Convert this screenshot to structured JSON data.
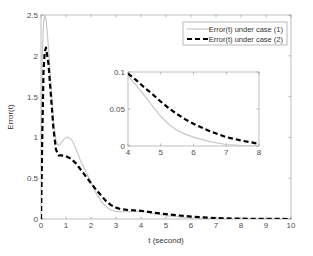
{
  "chart_data": [
    {
      "type": "line",
      "role": "main",
      "title": "",
      "xlabel": "t (second)",
      "ylabel": "Error(t)",
      "xlim": [
        0,
        10
      ],
      "ylim": [
        0,
        2.5
      ],
      "xticks": [
        0,
        1,
        2,
        3,
        4,
        5,
        6,
        7,
        8,
        9,
        10
      ],
      "yticks": [
        0,
        0.5,
        1,
        1.5,
        2,
        2.5
      ],
      "xtick_labels": [
        "0",
        "1",
        "2",
        "3",
        "4",
        "5",
        "6",
        "7",
        "8",
        "9",
        "10"
      ],
      "ytick_labels": [
        "0",
        "0.5",
        "1",
        "1.5",
        "2",
        "2.5"
      ],
      "grid": false,
      "legend_position": "upper right",
      "series": [
        {
          "name": "Error(t) under case (1)",
          "style": "solid",
          "color": "#c8c8c8",
          "x": [
            0,
            0.05,
            0.1,
            0.15,
            0.2,
            0.3,
            0.4,
            0.5,
            0.6,
            0.7,
            0.8,
            0.9,
            1.0,
            1.1,
            1.2,
            1.3,
            1.4,
            1.5,
            1.6,
            1.8,
            2.0,
            2.2,
            2.4,
            2.6,
            2.8,
            3.0,
            3.5,
            4.0,
            5.0,
            6.0,
            7.0,
            8.0,
            9.0,
            10.0
          ],
          "y": [
            0.9,
            2.0,
            2.4,
            2.5,
            2.45,
            2.1,
            1.65,
            1.2,
            0.95,
            0.9,
            0.93,
            0.97,
            1.0,
            1.0,
            0.98,
            0.93,
            0.86,
            0.78,
            0.7,
            0.58,
            0.45,
            0.32,
            0.22,
            0.15,
            0.11,
            0.09,
            0.09,
            0.095,
            0.04,
            0.012,
            0.002,
            0.0,
            0.0,
            0.0
          ]
        },
        {
          "name": "Error(t) under case (2)",
          "style": "dashed",
          "color": "#000000",
          "x": [
            0,
            0.05,
            0.1,
            0.15,
            0.2,
            0.3,
            0.4,
            0.5,
            0.6,
            0.7,
            0.8,
            1.0,
            1.2,
            1.4,
            1.6,
            1.8,
            2.0,
            2.2,
            2.4,
            2.6,
            2.8,
            3.0,
            3.2,
            3.5,
            4.0,
            4.5,
            5.0,
            5.5,
            6.0,
            6.5,
            7.0,
            7.5,
            8.0,
            9.0,
            10.0
          ],
          "y": [
            0.0,
            1.0,
            1.8,
            2.05,
            2.1,
            1.9,
            1.5,
            1.1,
            0.85,
            0.78,
            0.78,
            0.77,
            0.74,
            0.68,
            0.6,
            0.52,
            0.44,
            0.36,
            0.29,
            0.22,
            0.17,
            0.14,
            0.12,
            0.11,
            0.1,
            0.078,
            0.06,
            0.043,
            0.03,
            0.02,
            0.012,
            0.007,
            0.004,
            0.001,
            0.0
          ]
        }
      ]
    },
    {
      "type": "line",
      "role": "inset",
      "title": "",
      "xlabel": "",
      "ylabel": "",
      "xlim": [
        4,
        8
      ],
      "ylim": [
        0,
        0.1
      ],
      "xticks": [
        4,
        5,
        6,
        7,
        8
      ],
      "yticks": [
        0,
        0.05,
        0.1
      ],
      "xtick_labels": [
        "4",
        "5",
        "6",
        "7",
        "8"
      ],
      "ytick_labels": [
        "0",
        "0.05",
        "0.1"
      ],
      "grid": false,
      "series": [
        {
          "name": "Error(t) under case (1)",
          "style": "solid",
          "color": "#c8c8c8",
          "x": [
            4.0,
            4.25,
            4.5,
            4.75,
            5.0,
            5.25,
            5.5,
            5.75,
            6.0,
            6.5,
            7.0,
            7.5,
            8.0
          ],
          "y": [
            0.095,
            0.082,
            0.068,
            0.054,
            0.04,
            0.029,
            0.021,
            0.016,
            0.012,
            0.006,
            0.002,
            0.0005,
            0.0
          ]
        },
        {
          "name": "Error(t) under case (2)",
          "style": "dashed",
          "color": "#000000",
          "x": [
            4.0,
            4.25,
            4.5,
            4.75,
            5.0,
            5.25,
            5.5,
            5.75,
            6.0,
            6.5,
            7.0,
            7.5,
            8.0
          ],
          "y": [
            0.098,
            0.089,
            0.079,
            0.07,
            0.06,
            0.051,
            0.043,
            0.036,
            0.03,
            0.02,
            0.012,
            0.007,
            0.003
          ]
        }
      ]
    }
  ],
  "legend": {
    "items": [
      {
        "label": "Error(t) under case (1)"
      },
      {
        "label": "Error(t) under case (2)"
      }
    ]
  },
  "axes": {
    "xlabel": "t (second)",
    "ylabel": "Error(t)"
  }
}
